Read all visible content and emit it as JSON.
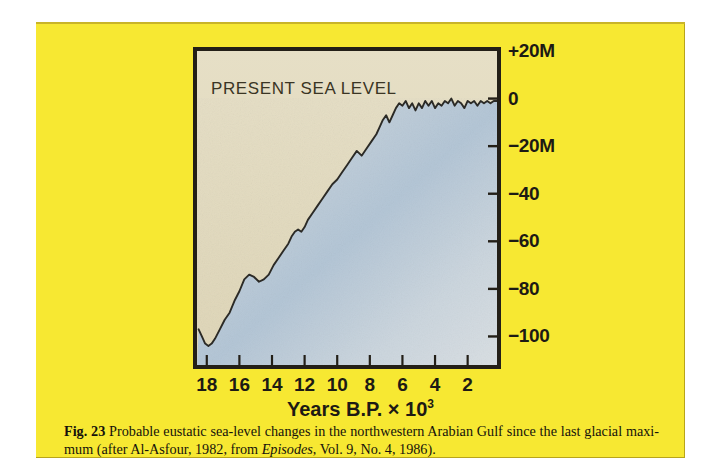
{
  "page": {
    "background_color": "#f7e832",
    "paper_color": "#ffffff"
  },
  "figure": {
    "annotation": "PRESENT SEA LEVEL",
    "frame_color": "#231f17"
  },
  "caption": {
    "figure_number": "Fig.  23",
    "text_part1": " Probable eustatic sea-level changes in the northwestern Arabian Gulf since the last glacial maxi-mum (after Al-Asfour, 1982, from ",
    "italic_source": "Episodes",
    "text_part2": ", Vol. 9, No. 4, 1986)."
  },
  "chart_data": {
    "type": "line",
    "title": "",
    "subtitle": "",
    "xlabel": "Years B.P. × 10³",
    "ylabel": "",
    "grid": false,
    "legend": "none",
    "annotations": [
      {
        "text": "PRESENT SEA LEVEL",
        "x": 17.2,
        "y": 10,
        "align": "left"
      }
    ],
    "x_axis": {
      "label": "Years B.P. × 10³",
      "ticks": [
        18,
        16,
        14,
        12,
        10,
        8,
        6,
        4,
        2
      ],
      "tick_labels": [
        "18",
        "16",
        "14",
        "12",
        "10",
        "8",
        "6",
        "4",
        "2"
      ],
      "min": 18.6,
      "max": 0.2,
      "direction": "reversed"
    },
    "y_axis": {
      "label": "",
      "unit": "M",
      "ticks": [
        20,
        0,
        -20,
        -40,
        -60,
        -80,
        -100
      ],
      "tick_labels": [
        "+20M",
        "0",
        "−20M",
        "−40",
        "−60",
        "−80",
        "−100"
      ],
      "min": -112,
      "max": 20
    },
    "series": [
      {
        "name": "Eustatic sea level",
        "color": "#2b2a26",
        "fill_above_color": "#ded6bb",
        "fill_below_color": "#9fb5c6",
        "x": [
          18.5,
          18.3,
          18.1,
          17.9,
          17.7,
          17.5,
          17.2,
          16.9,
          16.6,
          16.3,
          16.0,
          15.7,
          15.4,
          15.1,
          14.8,
          14.5,
          14.2,
          13.9,
          13.6,
          13.3,
          13.0,
          12.8,
          12.6,
          12.4,
          12.2,
          12.0,
          11.8,
          11.5,
          11.2,
          10.9,
          10.6,
          10.3,
          10.0,
          9.7,
          9.4,
          9.1,
          8.8,
          8.5,
          8.2,
          7.9,
          7.6,
          7.4,
          7.2,
          7.0,
          6.8,
          6.6,
          6.4,
          6.2,
          6.0,
          5.8,
          5.6,
          5.4,
          5.2,
          5.0,
          4.8,
          4.6,
          4.4,
          4.2,
          4.0,
          3.8,
          3.6,
          3.4,
          3.2,
          3.0,
          2.8,
          2.6,
          2.4,
          2.2,
          2.0,
          1.8,
          1.6,
          1.4,
          1.2,
          1.0,
          0.8,
          0.6,
          0.4,
          0.2
        ],
        "y": [
          -97,
          -100,
          -103,
          -104,
          -103,
          -101,
          -97,
          -93,
          -90,
          -85,
          -81,
          -76,
          -74,
          -75,
          -77,
          -76,
          -74,
          -70,
          -67,
          -64,
          -61,
          -58,
          -56,
          -55,
          -56,
          -54,
          -51,
          -48,
          -45,
          -42,
          -39,
          -36,
          -34,
          -31,
          -28,
          -25,
          -22,
          -24,
          -21,
          -18,
          -15,
          -12,
          -9,
          -7,
          -10,
          -7,
          -4,
          -2,
          -3,
          -1,
          -4,
          -2,
          -5,
          -2,
          -4,
          -1,
          -3,
          -1,
          -4,
          -2,
          -3,
          -1,
          -2,
          0,
          -3,
          -1,
          -2,
          -4,
          -1,
          -2,
          -1,
          -3,
          -1,
          -2,
          -1,
          -2,
          -1,
          -1
        ]
      }
    ]
  }
}
